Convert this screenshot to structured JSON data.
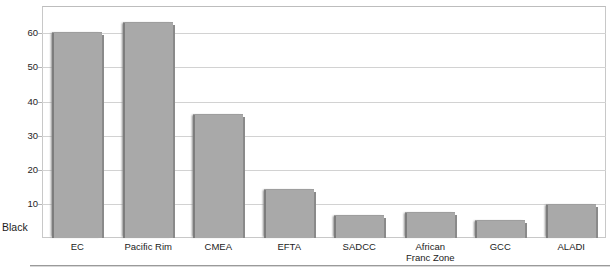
{
  "chart_data": {
    "type": "bar",
    "title": "",
    "xlabel": "",
    "ylabel": "",
    "series_label": "Black",
    "categories": [
      "EC",
      "Pacific Rim",
      "CMEA",
      "EFTA",
      "SADCC",
      "African\nFranc Zone",
      "GCC",
      "ALADI"
    ],
    "category_lines": [
      [
        "EC"
      ],
      [
        "Pacific Rim"
      ],
      [
        "CMEA"
      ],
      [
        "EFTA"
      ],
      [
        "SADCC"
      ],
      [
        "African",
        "Franc Zone"
      ],
      [
        "GCC"
      ],
      [
        "ALADI"
      ]
    ],
    "values": [
      60,
      63,
      36,
      14,
      6.5,
      7.4,
      5,
      9.8
    ],
    "ylim": [
      0,
      68
    ],
    "yticks": [
      10,
      20,
      30,
      40,
      50,
      60
    ],
    "ytick_labels": [
      "10",
      "20",
      "30",
      "40",
      "50",
      "60"
    ],
    "grid": true,
    "legend": "none",
    "bar_color": "#a9a9a9",
    "grid_color": "#d2d2d2",
    "frame_color": "#c8c8c8"
  },
  "labels": {
    "tick_10": "10",
    "tick_20": "20",
    "tick_30": "30",
    "tick_40": "40",
    "tick_50": "50",
    "tick_60": "60",
    "cat_0": "EC",
    "cat_1": "Pacific Rim",
    "cat_2": "CMEA",
    "cat_3": "EFTA",
    "cat_4": "SADCC",
    "cat_5_line1": "African",
    "cat_5_line2": "Franc Zone",
    "cat_6": "GCC",
    "cat_7": "ALADI",
    "series_label": "Black",
    "title_clipped": ""
  }
}
